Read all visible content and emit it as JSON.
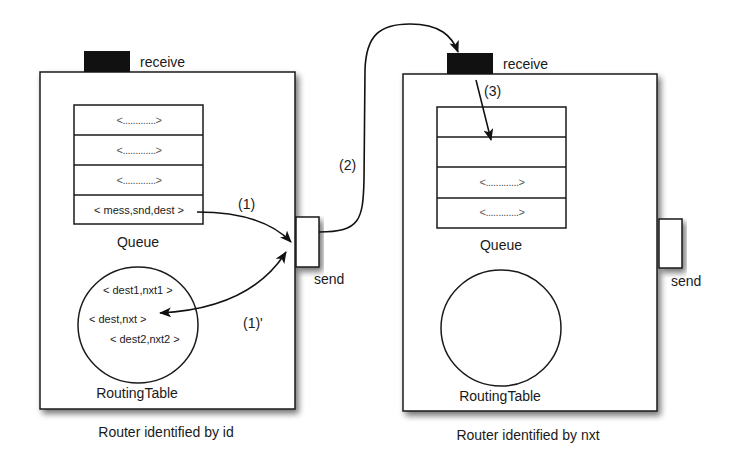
{
  "diagram": {
    "type": "message-routing",
    "colors": {
      "stroke": "#1a1a1a",
      "port_fill": "#111111",
      "box_fill": "#ffffff",
      "shadow": "#9a9a9a"
    },
    "routers": [
      {
        "id": "router-id",
        "caption": "Router identified by id",
        "receive_label": "receive",
        "send_label": "send",
        "queue_label": "Queue",
        "table_label": "RoutingTable",
        "queue_rows": [
          "<.............>",
          "<.............>",
          "<.............>",
          "< mess,snd,dest >"
        ],
        "table_entries": [
          "< dest1,nxt1 >",
          "< dest,nxt >",
          "< dest2,nxt2 >"
        ]
      },
      {
        "id": "router-nxt",
        "caption": "Router identified by nxt",
        "receive_label": "receive",
        "send_label": "send",
        "queue_label": "Queue",
        "table_label": "RoutingTable",
        "queue_rows": [
          "",
          "",
          "<.............>",
          "<.............>"
        ],
        "table_entries": []
      }
    ],
    "steps": [
      {
        "label": "(1)",
        "description": "message dequeued to send port"
      },
      {
        "label": "(1)'",
        "description": "routing table lookup dest -> nxt"
      },
      {
        "label": "(2)",
        "description": "send to receive port of next router"
      },
      {
        "label": "(3)",
        "description": "enqueue in next router's queue"
      }
    ]
  }
}
